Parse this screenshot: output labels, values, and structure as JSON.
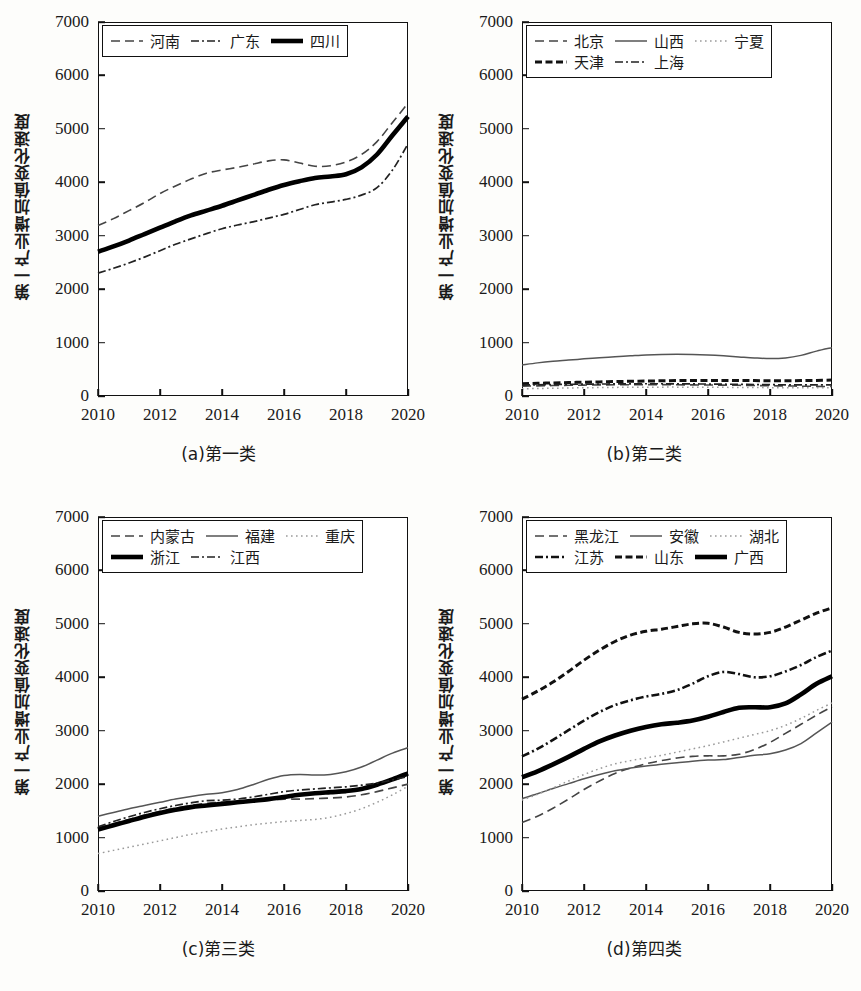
{
  "figure": {
    "ylabel": "第一产业增加值变化速度",
    "y_ticks": [
      "0",
      "1000",
      "2000",
      "3000",
      "4000",
      "5000",
      "6000",
      "7000"
    ],
    "x_ticks": [
      "2010",
      "2012",
      "2014",
      "2016",
      "2018",
      "2020"
    ],
    "ylim": [
      0,
      7000
    ],
    "xlim": [
      2010,
      2020
    ],
    "grid": false,
    "legend_position": "upper-left-inside"
  },
  "panels": [
    {
      "id": "a",
      "caption": "(a)第一类",
      "legend_rows": [
        [
          "河南",
          "广东",
          "四川"
        ]
      ]
    },
    {
      "id": "b",
      "caption": "(b)第二类",
      "legend_rows": [
        [
          "北京",
          "山西",
          "宁夏"
        ],
        [
          "天津",
          "上海",
          ""
        ]
      ]
    },
    {
      "id": "c",
      "caption": "(c)第三类",
      "legend_rows": [
        [
          "内蒙古",
          "福建",
          "重庆"
        ],
        [
          "浙江",
          "江西",
          ""
        ]
      ]
    },
    {
      "id": "d",
      "caption": "(d)第四类",
      "legend_rows": [
        [
          "黑龙江",
          "安徽",
          "湖北"
        ],
        [
          "江苏",
          "山东",
          "广西"
        ]
      ]
    }
  ],
  "chart_data": [
    {
      "type": "line",
      "title": "(a)第一类",
      "xlabel": "",
      "ylabel": "第一产业增加值变化速度",
      "xlim": [
        2010,
        2020
      ],
      "ylim": [
        0,
        7000
      ],
      "x": [
        2010,
        2010.5,
        2011,
        2011.5,
        2012,
        2012.5,
        2013,
        2013.5,
        2014,
        2014.5,
        2015,
        2015.5,
        2016,
        2016.5,
        2017,
        2017.5,
        2018,
        2018.5,
        2019,
        2019.5,
        2020
      ],
      "series": [
        {
          "name": "河南",
          "style": "dashed",
          "values": [
            3190,
            3320,
            3470,
            3620,
            3790,
            3930,
            4060,
            4170,
            4230,
            4280,
            4340,
            4400,
            4420,
            4360,
            4300,
            4310,
            4380,
            4520,
            4760,
            5120,
            5480
          ]
        },
        {
          "name": "广东",
          "style": "dashdot-thin",
          "values": [
            2300,
            2390,
            2490,
            2600,
            2720,
            2840,
            2940,
            3040,
            3130,
            3200,
            3260,
            3330,
            3400,
            3490,
            3580,
            3630,
            3680,
            3760,
            3900,
            4230,
            4720
          ]
        },
        {
          "name": "四川",
          "style": "solid-thick",
          "values": [
            2700,
            2800,
            2910,
            3030,
            3150,
            3270,
            3380,
            3470,
            3560,
            3660,
            3760,
            3860,
            3950,
            4020,
            4080,
            4110,
            4150,
            4280,
            4520,
            4880,
            5230
          ]
        }
      ]
    },
    {
      "type": "line",
      "title": "(b)第二类",
      "xlabel": "",
      "ylabel": "第一产业增加值变化速度",
      "xlim": [
        2010,
        2020
      ],
      "ylim": [
        0,
        7000
      ],
      "x": [
        2010,
        2010.5,
        2011,
        2011.5,
        2012,
        2012.5,
        2013,
        2013.5,
        2014,
        2014.5,
        2015,
        2015.5,
        2016,
        2016.5,
        2017,
        2017.5,
        2018,
        2018.5,
        2019,
        2019.5,
        2020
      ],
      "series": [
        {
          "name": "北京",
          "style": "dashed",
          "values": [
            185,
            190,
            196,
            200,
            204,
            208,
            210,
            212,
            213,
            212,
            210,
            208,
            206,
            203,
            200,
            196,
            192,
            188,
            184,
            180,
            176
          ]
        },
        {
          "name": "山西",
          "style": "solid-thin",
          "values": [
            580,
            620,
            650,
            672,
            695,
            715,
            735,
            752,
            768,
            778,
            782,
            778,
            768,
            752,
            732,
            712,
            700,
            712,
            760,
            840,
            905
          ]
        },
        {
          "name": "宁夏",
          "style": "dotted",
          "values": [
            135,
            140,
            145,
            150,
            154,
            158,
            161,
            163,
            165,
            166,
            166,
            165,
            164,
            162,
            160,
            158,
            156,
            155,
            154,
            153,
            152
          ]
        },
        {
          "name": "天津",
          "style": "dashed-thick",
          "values": [
            230,
            238,
            245,
            252,
            258,
            264,
            270,
            275,
            280,
            284,
            288,
            290,
            292,
            292,
            290,
            288,
            286,
            286,
            288,
            292,
            298
          ]
        },
        {
          "name": "上海",
          "style": "dashdot-thin",
          "values": [
            205,
            210,
            214,
            218,
            221,
            224,
            226,
            228,
            229,
            229,
            228,
            226,
            224,
            221,
            218,
            215,
            212,
            210,
            209,
            208,
            207
          ]
        }
      ]
    },
    {
      "type": "line",
      "title": "(c)第三类",
      "xlabel": "",
      "ylabel": "第一产业增加值变化速度",
      "xlim": [
        2010,
        2020
      ],
      "ylim": [
        0,
        7000
      ],
      "x": [
        2010,
        2010.5,
        2011,
        2011.5,
        2012,
        2012.5,
        2013,
        2013.5,
        2014,
        2014.5,
        2015,
        2015.5,
        2016,
        2016.5,
        2017,
        2017.5,
        2018,
        2018.5,
        2019,
        2019.5,
        2020
      ],
      "series": [
        {
          "name": "内蒙古",
          "style": "dashed",
          "values": [
            1180,
            1260,
            1340,
            1420,
            1490,
            1550,
            1600,
            1640,
            1660,
            1670,
            1680,
            1700,
            1720,
            1720,
            1730,
            1740,
            1760,
            1800,
            1860,
            1930,
            2000
          ]
        },
        {
          "name": "福建",
          "style": "solid-thin",
          "values": [
            1400,
            1470,
            1540,
            1600,
            1660,
            1720,
            1770,
            1810,
            1840,
            1900,
            1990,
            2090,
            2160,
            2180,
            2170,
            2180,
            2230,
            2320,
            2450,
            2580,
            2680
          ]
        },
        {
          "name": "重庆",
          "style": "dotted",
          "values": [
            700,
            760,
            820,
            880,
            940,
            1000,
            1060,
            1110,
            1160,
            1200,
            1240,
            1270,
            1300,
            1320,
            1340,
            1380,
            1450,
            1540,
            1660,
            1800,
            1960
          ]
        },
        {
          "name": "浙江",
          "style": "solid-thick",
          "values": [
            1150,
            1230,
            1310,
            1390,
            1460,
            1520,
            1570,
            1600,
            1630,
            1660,
            1690,
            1720,
            1760,
            1800,
            1830,
            1850,
            1870,
            1910,
            1990,
            2090,
            2200
          ]
        },
        {
          "name": "江西",
          "style": "dashdot-thin",
          "values": [
            1200,
            1300,
            1390,
            1470,
            1540,
            1600,
            1650,
            1690,
            1700,
            1720,
            1760,
            1810,
            1860,
            1890,
            1910,
            1930,
            1950,
            1980,
            2020,
            2080,
            2140
          ]
        }
      ]
    },
    {
      "type": "line",
      "title": "(d)第四类",
      "xlabel": "",
      "ylabel": "第一产业增加值变化速度",
      "xlim": [
        2010,
        2020
      ],
      "ylim": [
        0,
        7000
      ],
      "x": [
        2010,
        2010.5,
        2011,
        2011.5,
        2012,
        2012.5,
        2013,
        2013.5,
        2014,
        2014.5,
        2015,
        2015.5,
        2016,
        2016.5,
        2017,
        2017.5,
        2018,
        2018.5,
        2019,
        2019.5,
        2020
      ],
      "series": [
        {
          "name": "黑龙江",
          "style": "dashed",
          "values": [
            1280,
            1400,
            1550,
            1720,
            1900,
            2060,
            2200,
            2300,
            2380,
            2440,
            2490,
            2520,
            2530,
            2530,
            2560,
            2650,
            2780,
            2950,
            3120,
            3290,
            3450
          ]
        },
        {
          "name": "安徽",
          "style": "solid-thin",
          "values": [
            1730,
            1820,
            1920,
            2010,
            2100,
            2180,
            2250,
            2300,
            2340,
            2370,
            2400,
            2430,
            2450,
            2460,
            2500,
            2540,
            2570,
            2640,
            2760,
            2960,
            3160
          ]
        },
        {
          "name": "湖北",
          "style": "dotted",
          "values": [
            1700,
            1810,
            1930,
            2060,
            2180,
            2290,
            2380,
            2440,
            2490,
            2540,
            2600,
            2660,
            2720,
            2790,
            2860,
            2930,
            3000,
            3100,
            3230,
            3380,
            3520
          ]
        },
        {
          "name": "江苏",
          "style": "dashdot-thick",
          "values": [
            2520,
            2660,
            2830,
            3010,
            3190,
            3350,
            3480,
            3570,
            3640,
            3690,
            3760,
            3880,
            4020,
            4100,
            4060,
            4000,
            4020,
            4110,
            4230,
            4380,
            4500
          ]
        },
        {
          "name": "山东",
          "style": "dashed-thick",
          "values": [
            3590,
            3740,
            3910,
            4110,
            4320,
            4510,
            4670,
            4790,
            4860,
            4900,
            4950,
            5000,
            5010,
            4940,
            4840,
            4810,
            4840,
            4940,
            5070,
            5200,
            5300
          ]
        },
        {
          "name": "广西",
          "style": "solid-thick-black",
          "values": [
            2130,
            2240,
            2370,
            2510,
            2660,
            2800,
            2910,
            3000,
            3070,
            3120,
            3150,
            3190,
            3260,
            3350,
            3430,
            3440,
            3440,
            3510,
            3680,
            3880,
            4020
          ]
        }
      ]
    }
  ]
}
